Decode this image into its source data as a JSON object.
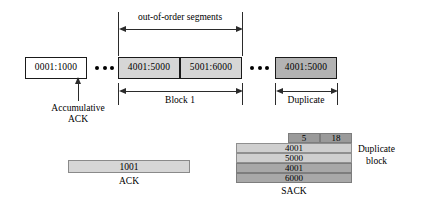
{
  "diagram": {
    "title_note": "TCP SACK option illustration",
    "top_bracket_label": "out-of-order  segments",
    "segments": [
      {
        "label": "0001:1000",
        "style": "white"
      },
      {
        "label": "4001:5000",
        "style": "light"
      },
      {
        "label": "5001:6000",
        "style": "light"
      },
      {
        "label": "4001:5000",
        "style": "dark"
      }
    ],
    "ellipsis_glyph": "•••",
    "accumulative_ack_label_line1": "Accumulative",
    "accumulative_ack_label_line2": "ACK",
    "block1_label": "Block 1",
    "duplicate_label": "Duplicate",
    "ack_bar": {
      "value": "1001",
      "caption": "ACK"
    },
    "sack": {
      "caption": "SACK",
      "side_label_line1": "Duplicate",
      "side_label_line2": "block",
      "header": [
        "5",
        "18"
      ],
      "rows": [
        "4001",
        "5000",
        "4001",
        "6000"
      ]
    },
    "colors": {
      "white_segment": "#ffffff",
      "light_segment": "#d6d6d6",
      "dark_segment": "#b3b3b3",
      "sack_header": "#9a9a9a",
      "sack_row_light": "#cfcfcf",
      "sack_row_dark": "#a8a8a8",
      "stroke": "#1a1a1a",
      "background": "#ffffff"
    }
  }
}
